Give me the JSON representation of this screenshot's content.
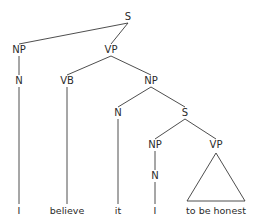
{
  "diagram": {
    "type": "syntax-tree",
    "nodes": [
      {
        "id": "s_root",
        "label": "S"
      },
      {
        "id": "np1",
        "label": "NP"
      },
      {
        "id": "vp1",
        "label": "VP"
      },
      {
        "id": "n1",
        "label": "N"
      },
      {
        "id": "vb",
        "label": "VB"
      },
      {
        "id": "np2",
        "label": "NP"
      },
      {
        "id": "n2",
        "label": "N"
      },
      {
        "id": "s2",
        "label": "S"
      },
      {
        "id": "np3",
        "label": "NP"
      },
      {
        "id": "vp2",
        "label": "VP"
      },
      {
        "id": "n3",
        "label": "N"
      }
    ],
    "leaves": [
      {
        "id": "w1",
        "label": "I"
      },
      {
        "id": "w2",
        "label": "believe"
      },
      {
        "id": "w3",
        "label": "it"
      },
      {
        "id": "w4",
        "label": "I"
      },
      {
        "id": "w5",
        "label": "to be honest"
      }
    ],
    "edges": [
      [
        "s_root",
        "np1"
      ],
      [
        "s_root",
        "vp1"
      ],
      [
        "np1",
        "n1"
      ],
      [
        "n1",
        "w1"
      ],
      [
        "vp1",
        "vb"
      ],
      [
        "vp1",
        "np2"
      ],
      [
        "vb",
        "w2"
      ],
      [
        "np2",
        "n2"
      ],
      [
        "np2",
        "s2"
      ],
      [
        "n2",
        "w3"
      ],
      [
        "s2",
        "np3"
      ],
      [
        "s2",
        "vp2"
      ],
      [
        "np3",
        "n3"
      ],
      [
        "n3",
        "w4"
      ]
    ],
    "triangles": [
      {
        "parent": "vp2",
        "covers": "w5"
      }
    ]
  }
}
